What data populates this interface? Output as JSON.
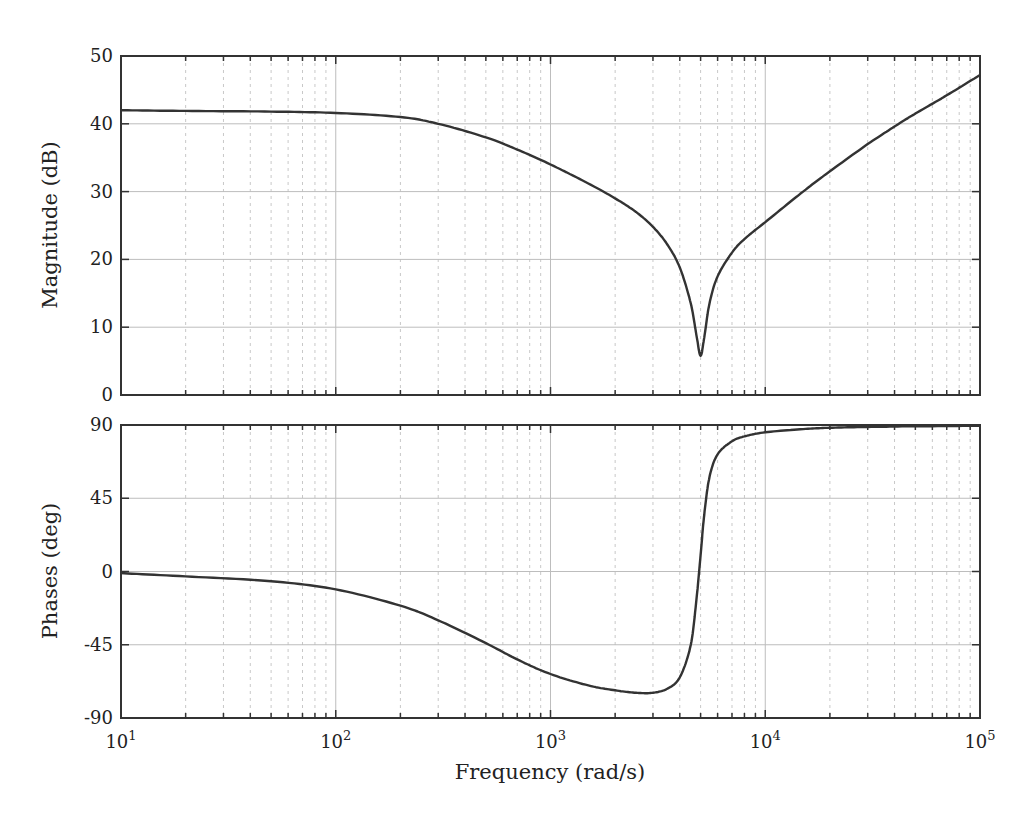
{
  "chart_data": {
    "type": "line",
    "title": "",
    "xlabel": "Frequency (rad/s)",
    "xscale": "log",
    "xlim": [
      10,
      100000
    ],
    "x_ticks": [
      {
        "base": "10",
        "exp": "1",
        "value": 10
      },
      {
        "base": "10",
        "exp": "2",
        "value": 100
      },
      {
        "base": "10",
        "exp": "3",
        "value": 1000
      },
      {
        "base": "10",
        "exp": "4",
        "value": 10000
      },
      {
        "base": "10",
        "exp": "5",
        "value": 100000
      }
    ],
    "grid": true,
    "minor_grid": true,
    "subplots": [
      {
        "name": "magnitude",
        "ylabel": "Magnitude (dB)",
        "ylim": [
          0,
          50
        ],
        "y_ticks": [
          0,
          10,
          20,
          30,
          40,
          50
        ],
        "series": [
          {
            "name": "Magnitude",
            "color": "#333333",
            "x": [
              10,
              20,
              50,
              100,
              200,
              300,
              500,
              700,
              1000,
              1500,
              2000,
              2500,
              3000,
              3500,
              4000,
              4500,
              4800,
              5000,
              5200,
              5500,
              6000,
              7000,
              8000,
              10000,
              15000,
              20000,
              30000,
              40000,
              50000,
              70000,
              100000
            ],
            "y": [
              42,
              41.9,
              41.8,
              41.6,
              41.0,
              40.0,
              38.0,
              36.2,
              34.0,
              31.2,
              29.0,
              27.0,
              24.8,
              22.2,
              18.8,
              13.5,
              8.5,
              5.8,
              8.5,
              13.5,
              17.5,
              21.0,
              23.0,
              25.5,
              30.0,
              33.0,
              37.0,
              39.6,
              41.5,
              44.2,
              47.2
            ]
          }
        ]
      },
      {
        "name": "phase",
        "ylabel": "Phases (deg)",
        "ylim": [
          -90,
          90
        ],
        "y_ticks": [
          -90,
          -45,
          0,
          45,
          90
        ],
        "series": [
          {
            "name": "Phase",
            "color": "#333333",
            "x": [
              10,
              20,
              50,
              100,
              200,
              300,
              500,
              700,
              1000,
              1500,
              2000,
              2500,
              3000,
              3500,
              4000,
              4500,
              4800,
              5000,
              5200,
              5500,
              6000,
              7000,
              8000,
              10000,
              15000,
              20000,
              30000,
              50000,
              100000
            ],
            "y": [
              -1,
              -3,
              -6,
              -11,
              -21,
              -30,
              -44,
              -54,
              -63,
              -70,
              -73,
              -74.5,
              -74.5,
              -72,
              -65,
              -45,
              -15,
              10,
              35,
              58,
              72,
              80,
              83,
              85.5,
              87.5,
              88.3,
              88.8,
              89.2,
              89.5
            ]
          }
        ]
      }
    ]
  }
}
